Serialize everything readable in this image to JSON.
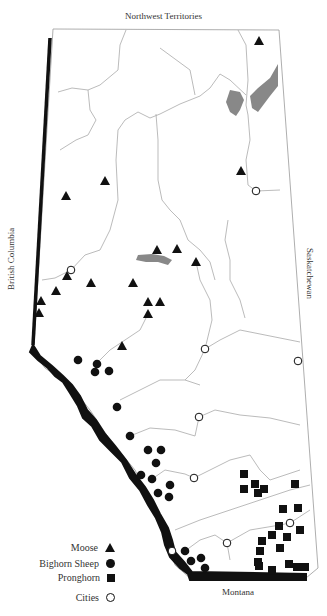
{
  "labels": {
    "north": "Northwest Territories",
    "west": "British Columbia",
    "east": "Saskatchewan",
    "south": "Montana"
  },
  "legend": [
    {
      "label": "Moose",
      "symbol": "triangle"
    },
    {
      "label": "Bighorn Sheep",
      "symbol": "circle-filled"
    },
    {
      "label": "Pronghorn",
      "symbol": "square"
    },
    {
      "label": "Cities",
      "symbol": "circle-open"
    }
  ],
  "colors": {
    "border": "#999999",
    "rivers": "#aaaaaa",
    "lakes": "#888888",
    "mountains": "#111111",
    "symbols": "#111111"
  },
  "points": {
    "moose": [
      [
        259,
        41
      ],
      [
        241,
        171
      ],
      [
        105,
        181
      ],
      [
        66,
        196
      ],
      [
        157,
        250
      ],
      [
        177,
        249
      ],
      [
        196,
        262
      ],
      [
        67,
        276
      ],
      [
        133,
        283
      ],
      [
        91,
        283
      ],
      [
        56,
        291
      ],
      [
        41,
        301
      ],
      [
        148,
        302
      ],
      [
        160,
        302
      ],
      [
        39,
        313
      ],
      [
        148,
        314
      ],
      [
        122,
        346
      ]
    ],
    "bighorn_sheep": [
      [
        78,
        360
      ],
      [
        97,
        364
      ],
      [
        95,
        372
      ],
      [
        109,
        371
      ],
      [
        117,
        407
      ],
      [
        130,
        436
      ],
      [
        148,
        450
      ],
      [
        161,
        450
      ],
      [
        156,
        463
      ],
      [
        141,
        475
      ],
      [
        152,
        479
      ],
      [
        170,
        485
      ],
      [
        158,
        493
      ],
      [
        169,
        497
      ],
      [
        185,
        551
      ],
      [
        191,
        561
      ],
      [
        201,
        558
      ],
      [
        205,
        568
      ]
    ],
    "pronghorn": [
      [
        244,
        474
      ],
      [
        255,
        484
      ],
      [
        244,
        489
      ],
      [
        258,
        493
      ],
      [
        264,
        489
      ],
      [
        295,
        484
      ],
      [
        283,
        509
      ],
      [
        298,
        508
      ],
      [
        279,
        526
      ],
      [
        300,
        530
      ],
      [
        272,
        535
      ],
      [
        262,
        541
      ],
      [
        287,
        537
      ],
      [
        280,
        548
      ],
      [
        260,
        551
      ],
      [
        258,
        562
      ],
      [
        259,
        566
      ],
      [
        272,
        570
      ],
      [
        289,
        564
      ],
      [
        297,
        567
      ],
      [
        305,
        567
      ]
    ],
    "cities": [
      [
        256,
        191
      ],
      [
        71,
        270
      ],
      [
        205,
        349
      ],
      [
        298,
        361
      ],
      [
        199,
        417
      ],
      [
        194,
        478
      ],
      [
        290,
        523
      ],
      [
        227,
        543
      ],
      [
        172,
        551
      ]
    ]
  }
}
